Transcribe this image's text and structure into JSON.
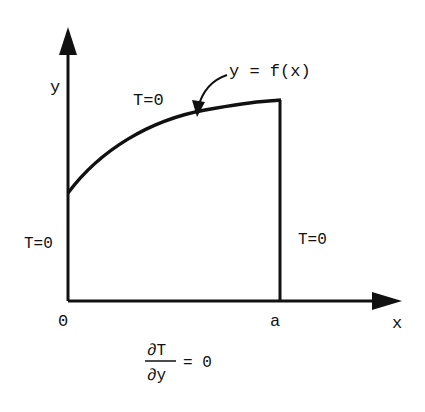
{
  "diagram": {
    "colors": {
      "ink": "#111111",
      "background": "#ffffff"
    },
    "axes": {
      "x_label": "x",
      "y_label": "y",
      "origin_label": "0",
      "a_label": "a"
    },
    "curve_label": "y = f(x)",
    "boundary_conditions": {
      "top": "T=0",
      "right": "T=0",
      "left": "T=0",
      "bottom": {
        "numerator": "∂T",
        "denominator": "∂y",
        "rhs": "= 0"
      }
    }
  }
}
